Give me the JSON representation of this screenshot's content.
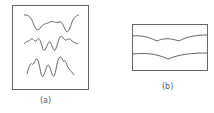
{
  "panels": [
    {
      "label": "(a)",
      "description": "three waveforms with increasing oscillation"
    },
    {
      "label": "(b)",
      "description": "two layered boundary curves with dips"
    }
  ],
  "colors": {
    "stroke": "#555555",
    "background": "#ffffff"
  }
}
